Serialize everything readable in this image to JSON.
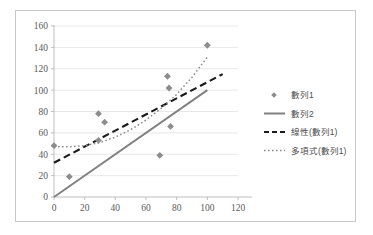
{
  "chart_data": {
    "type": "scatter",
    "title": "",
    "xlabel": "",
    "ylabel": "",
    "xlim": [
      0,
      120
    ],
    "ylim": [
      0,
      160
    ],
    "xticks": [
      0,
      20,
      40,
      60,
      80,
      100,
      120
    ],
    "yticks": [
      0,
      20,
      40,
      60,
      80,
      100,
      120,
      140,
      160
    ],
    "grid": "horizontal",
    "legend_position": "right",
    "series": [
      {
        "name": "數列1",
        "type": "scatter",
        "marker": "diamond",
        "color": "#8c8c8c",
        "points": [
          {
            "x": 0,
            "y": 48
          },
          {
            "x": 10,
            "y": 19
          },
          {
            "x": 29,
            "y": 78
          },
          {
            "x": 29,
            "y": 53
          },
          {
            "x": 33,
            "y": 70
          },
          {
            "x": 69,
            "y": 39
          },
          {
            "x": 74,
            "y": 113
          },
          {
            "x": 75,
            "y": 102
          },
          {
            "x": 76,
            "y": 66
          },
          {
            "x": 100,
            "y": 142
          }
        ]
      },
      {
        "name": "數列2",
        "type": "line",
        "style": "solid",
        "color": "#808080",
        "points": [
          {
            "x": 0,
            "y": 0
          },
          {
            "x": 100,
            "y": 100
          }
        ]
      },
      {
        "name": "線性(數列1)",
        "type": "trendline-linear",
        "style": "dashed",
        "color": "#1a1a1a",
        "points": [
          {
            "x": 0,
            "y": 32
          },
          {
            "x": 110,
            "y": 115
          }
        ]
      },
      {
        "name": "多項式(數列1)",
        "type": "trendline-polynomial",
        "style": "dotted",
        "color": "#8c8c8c",
        "points": [
          {
            "x": 0,
            "y": 47
          },
          {
            "x": 10,
            "y": 47
          },
          {
            "x": 20,
            "y": 48
          },
          {
            "x": 30,
            "y": 51
          },
          {
            "x": 40,
            "y": 56
          },
          {
            "x": 50,
            "y": 63
          },
          {
            "x": 60,
            "y": 72
          },
          {
            "x": 70,
            "y": 83
          },
          {
            "x": 80,
            "y": 96
          },
          {
            "x": 90,
            "y": 112
          },
          {
            "x": 100,
            "y": 131
          }
        ]
      }
    ],
    "legend_entries": [
      {
        "label": "數列1",
        "marker": "diamond",
        "color": "#8c8c8c"
      },
      {
        "label": "數列2",
        "marker": "solid-line",
        "color": "#808080"
      },
      {
        "label": "線性(數列1)",
        "marker": "dashed-line",
        "color": "#1a1a1a"
      },
      {
        "label": "多項式(數列1)",
        "marker": "dotted-line",
        "color": "#8c8c8c"
      }
    ],
    "colors": {
      "frame_border": "#c8c8c8",
      "axis_line": "#bfbfbf",
      "gridline": "#e8e8e8",
      "tick_label": "#5a5a5a",
      "background": "#ffffff"
    }
  }
}
